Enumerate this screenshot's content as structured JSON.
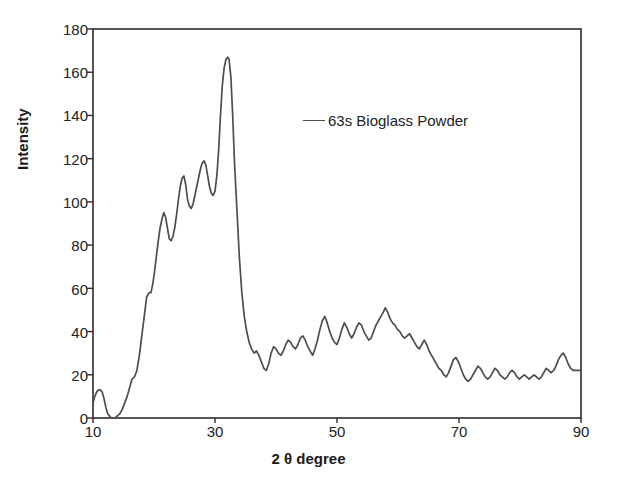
{
  "chart_data": {
    "type": "line",
    "title": "",
    "xlabel": "2 θ degree",
    "ylabel": "Intensity",
    "xlim": [
      10,
      90
    ],
    "ylim": [
      0,
      180
    ],
    "xticks": [
      10,
      30,
      50,
      70,
      90
    ],
    "yticks": [
      0,
      20,
      40,
      60,
      80,
      100,
      120,
      140,
      160,
      180
    ],
    "grid": false,
    "legend_position": "upper-center-right",
    "series": [
      {
        "name": "63s Bioglass Powder",
        "color": "#4d4d4d",
        "x": [
          10.0,
          10.3,
          10.6,
          10.9,
          11.2,
          11.5,
          11.8,
          12.1,
          12.4,
          12.7,
          13.0,
          13.3,
          13.6,
          14.0,
          14.4,
          14.8,
          15.2,
          15.6,
          16.0,
          16.4,
          16.8,
          17.2,
          17.6,
          18.0,
          18.4,
          18.8,
          19.2,
          19.5,
          19.8,
          20.1,
          20.4,
          20.7,
          21.0,
          21.3,
          21.6,
          21.9,
          22.2,
          22.5,
          22.8,
          23.1,
          23.4,
          23.7,
          24.0,
          24.3,
          24.6,
          24.9,
          25.2,
          25.5,
          25.8,
          26.1,
          26.4,
          26.7,
          27.0,
          27.3,
          27.6,
          27.9,
          28.2,
          28.5,
          28.8,
          29.1,
          29.4,
          29.7,
          30.0,
          30.3,
          30.6,
          30.9,
          31.2,
          31.5,
          31.8,
          32.1,
          32.3,
          32.6,
          32.9,
          33.2,
          33.6,
          34.0,
          34.4,
          34.8,
          35.2,
          35.6,
          36.0,
          36.4,
          36.8,
          37.2,
          37.6,
          38.0,
          38.4,
          38.8,
          39.2,
          39.6,
          40.0,
          40.4,
          40.8,
          41.2,
          41.6,
          42.0,
          42.4,
          42.8,
          43.2,
          43.6,
          44.0,
          44.4,
          44.8,
          45.2,
          45.6,
          46.0,
          46.4,
          46.8,
          47.2,
          47.6,
          48.0,
          48.4,
          48.8,
          49.2,
          49.6,
          50.0,
          50.4,
          50.8,
          51.2,
          51.6,
          52.0,
          52.4,
          52.8,
          53.2,
          53.6,
          54.0,
          54.4,
          54.8,
          55.2,
          55.6,
          56.0,
          56.4,
          56.8,
          57.2,
          57.6,
          57.9,
          58.3,
          58.7,
          59.1,
          59.5,
          59.9,
          60.3,
          60.7,
          61.1,
          61.5,
          61.9,
          62.3,
          62.7,
          63.1,
          63.5,
          63.9,
          64.3,
          64.7,
          65.1,
          65.5,
          65.9,
          66.3,
          66.7,
          67.1,
          67.5,
          67.9,
          68.3,
          68.7,
          69.1,
          69.5,
          69.9,
          70.3,
          70.7,
          71.1,
          71.5,
          71.9,
          72.3,
          72.7,
          73.1,
          73.5,
          73.9,
          74.3,
          74.7,
          75.1,
          75.5,
          75.9,
          76.3,
          76.7,
          77.1,
          77.5,
          77.9,
          78.3,
          78.7,
          79.1,
          79.5,
          79.9,
          80.3,
          80.7,
          81.1,
          81.5,
          81.9,
          82.3,
          82.7,
          83.1,
          83.5,
          83.9,
          84.3,
          84.7,
          85.1,
          85.5,
          85.9,
          86.3,
          86.7,
          87.1,
          87.5,
          87.9,
          88.3,
          88.7,
          89.1,
          89.5,
          90.0
        ],
        "y": [
          7,
          10,
          12,
          13,
          13,
          12,
          9,
          5,
          2,
          1,
          0,
          0,
          0,
          1,
          2,
          4,
          7,
          10,
          14,
          18,
          19,
          22,
          29,
          38,
          47,
          56,
          58,
          58,
          62,
          68,
          75,
          82,
          88,
          92,
          95,
          93,
          88,
          83,
          82,
          84,
          88,
          94,
          101,
          107,
          111,
          112,
          108,
          101,
          98,
          97,
          99,
          103,
          107,
          111,
          115,
          118,
          119,
          117,
          112,
          107,
          104,
          103,
          105,
          112,
          124,
          140,
          154,
          162,
          166,
          167,
          166,
          158,
          140,
          118,
          96,
          74,
          58,
          47,
          40,
          35,
          32,
          30,
          31,
          29,
          26,
          23,
          22,
          25,
          30,
          33,
          32,
          30,
          29,
          31,
          34,
          36,
          35,
          33,
          32,
          34,
          37,
          38,
          36,
          33,
          31,
          29,
          32,
          36,
          41,
          45,
          47,
          44,
          40,
          37,
          35,
          34,
          37,
          41,
          44,
          42,
          39,
          37,
          39,
          42,
          44,
          43,
          40,
          38,
          36,
          37,
          40,
          43,
          45,
          47,
          49,
          51,
          49,
          46,
          44,
          43,
          41,
          40,
          38,
          37,
          38,
          39,
          37,
          35,
          33,
          32,
          34,
          36,
          34,
          31,
          29,
          27,
          25,
          23,
          22,
          20,
          19,
          21,
          24,
          27,
          28,
          26,
          23,
          20,
          18,
          17,
          18,
          20,
          22,
          24,
          23,
          21,
          19,
          18,
          19,
          21,
          23,
          22,
          20,
          19,
          18,
          19,
          21,
          22,
          21,
          19,
          18,
          19,
          20,
          19,
          18,
          19,
          20,
          19,
          18,
          19,
          21,
          23,
          22,
          21,
          22,
          24,
          27,
          29,
          30,
          28,
          25,
          23,
          22,
          22,
          22,
          22
        ]
      }
    ]
  },
  "legend": {
    "entries": [
      {
        "label": "63s Bioglass Powder",
        "marker": "line-marker",
        "color": "#4d4d4d"
      }
    ]
  },
  "axes": {
    "y_title": "Intensity",
    "x_title": "2 θ degree",
    "x_tick_labels": [
      "10",
      "30",
      "50",
      "70",
      "90"
    ],
    "y_tick_labels": [
      "0",
      "20",
      "40",
      "60",
      "80",
      "100",
      "120",
      "140",
      "160",
      "180"
    ]
  },
  "style": {
    "frame_color": "#2b2b2b",
    "curve_color": "#4d4d4d",
    "background": "#ffffff"
  }
}
